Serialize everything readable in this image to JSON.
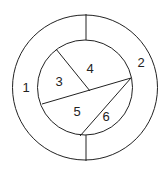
{
  "diagram": {
    "outer_circle": {
      "cx": 85,
      "cy": 87.5,
      "r": 72.5
    },
    "inner_circle": {
      "cx": 85,
      "cy": 87.5,
      "r": 47.5
    },
    "color": "#222222",
    "regions": [
      {
        "id": "1",
        "label": "1",
        "x": 26,
        "y": 89
      },
      {
        "id": "2",
        "label": "2",
        "x": 141,
        "y": 64
      },
      {
        "id": "3",
        "label": "3",
        "x": 59,
        "y": 83
      },
      {
        "id": "4",
        "label": "4",
        "x": 90,
        "y": 70
      },
      {
        "id": "5",
        "label": "5",
        "x": 77,
        "y": 113
      },
      {
        "id": "6",
        "label": "6",
        "x": 106,
        "y": 118
      }
    ]
  }
}
